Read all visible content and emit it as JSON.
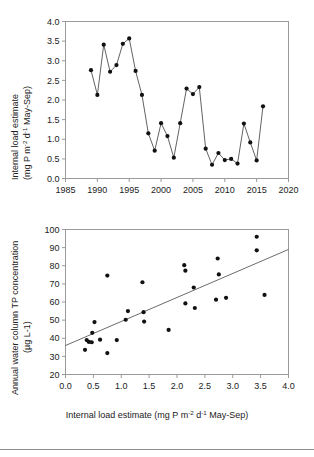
{
  "figure": {
    "name": "two-panel-figure",
    "background": "#ffffff",
    "point_color": "#111111",
    "line_color": "#3a3a3a",
    "axis_color": "#9a9a9a"
  },
  "panel_top": {
    "yaxis_title_line1": "Internal load estimate",
    "yaxis_title_line2_pre": "(mg P m",
    "yaxis_title_sup1": "-2",
    "yaxis_title_mid": " d",
    "yaxis_title_sup2": "-1",
    "yaxis_title_post": " May-Sep)",
    "xticks": [
      "1985",
      "1990",
      "1995",
      "2000",
      "2005",
      "2010",
      "2015",
      "2020"
    ],
    "yticks": [
      "0.0",
      "0.5",
      "1.0",
      "1.5",
      "2.0",
      "2.5",
      "3.0",
      "3.5",
      "4.0"
    ]
  },
  "panel_bottom": {
    "yaxis_title_line1": "Annual water column TP concentration",
    "yaxis_title_line2": "(µg L-1)",
    "xaxis_title_pre": "Internal load estimate (mg P m",
    "xaxis_title_sup1": "-2",
    "xaxis_title_mid": " d",
    "xaxis_title_sup2": "-1",
    "xaxis_title_post": " May-Sep)",
    "xticks": [
      "0.0",
      "0.5",
      "1.0",
      "1.5",
      "2.0",
      "2.5",
      "3.0",
      "3.5",
      "4.0"
    ],
    "yticks": [
      "20",
      "30",
      "40",
      "50",
      "60",
      "70",
      "80",
      "90",
      "100"
    ]
  },
  "chart_data": [
    {
      "type": "line",
      "id": "internal-load-timeseries",
      "title": "",
      "xlabel": "",
      "ylabel": "Internal load estimate (mg P m-2 d-1 May-Sep)",
      "xlim": [
        1985,
        2020
      ],
      "ylim": [
        0.0,
        4.0
      ],
      "xticks": [
        1985,
        1990,
        1995,
        2000,
        2005,
        2010,
        2015,
        2020
      ],
      "yticks": [
        0.0,
        0.5,
        1.0,
        1.5,
        2.0,
        2.5,
        3.0,
        3.5,
        4.0
      ],
      "grid": false,
      "legend": "none",
      "markers": true,
      "x": [
        1989,
        1990,
        1991,
        1992,
        1993,
        1994,
        1995,
        1996,
        1997,
        1998,
        1999,
        2000,
        2001,
        2002,
        2003,
        2004,
        2005,
        2006,
        2007,
        2008,
        2009,
        2010,
        2011,
        2012,
        2013,
        2014,
        2015,
        2016
      ],
      "y": [
        2.76,
        2.13,
        3.41,
        2.72,
        2.89,
        3.43,
        3.57,
        2.74,
        2.13,
        1.15,
        0.71,
        1.41,
        1.08,
        0.53,
        1.41,
        2.29,
        2.15,
        2.33,
        0.76,
        0.35,
        0.65,
        0.47,
        0.5,
        0.38,
        1.4,
        0.92,
        0.46,
        1.84
      ]
    },
    {
      "type": "scatter",
      "id": "tp-vs-internal-load",
      "title": "",
      "xlabel": "Internal load estimate (mg P m-2 d-1 May-Sep)",
      "ylabel": "Annual water column TP concentration (µg L-1)",
      "xlim": [
        0.0,
        4.0
      ],
      "ylim": [
        20,
        100
      ],
      "xticks": [
        0.0,
        0.5,
        1.0,
        1.5,
        2.0,
        2.5,
        3.0,
        3.5,
        4.0
      ],
      "yticks": [
        20,
        30,
        40,
        50,
        60,
        70,
        80,
        90,
        100
      ],
      "grid": false,
      "legend": "none",
      "points": [
        [
          0.35,
          33.6
        ],
        [
          0.38,
          39.0
        ],
        [
          0.42,
          38.0
        ],
        [
          0.47,
          37.8
        ],
        [
          0.48,
          43.0
        ],
        [
          0.52,
          48.9
        ],
        [
          0.62,
          39.2
        ],
        [
          0.75,
          74.6
        ],
        [
          0.75,
          31.8
        ],
        [
          0.92,
          39.0
        ],
        [
          1.08,
          50.2
        ],
        [
          1.12,
          55.0
        ],
        [
          1.38,
          70.9
        ],
        [
          1.4,
          54.4
        ],
        [
          1.41,
          49.2
        ],
        [
          1.85,
          44.6
        ],
        [
          2.13,
          80.3
        ],
        [
          2.15,
          77.3
        ],
        [
          2.15,
          59.2
        ],
        [
          2.3,
          68.0
        ],
        [
          2.32,
          56.7
        ],
        [
          2.7,
          61.3
        ],
        [
          2.73,
          84.0
        ],
        [
          2.75,
          75.2
        ],
        [
          2.88,
          62.3
        ],
        [
          3.43,
          96.0
        ],
        [
          3.43,
          88.5
        ],
        [
          3.57,
          63.9
        ]
      ],
      "trendline": {
        "x": [
          0.0,
          4.0
        ],
        "y": [
          36.0,
          89.0
        ]
      }
    }
  ]
}
